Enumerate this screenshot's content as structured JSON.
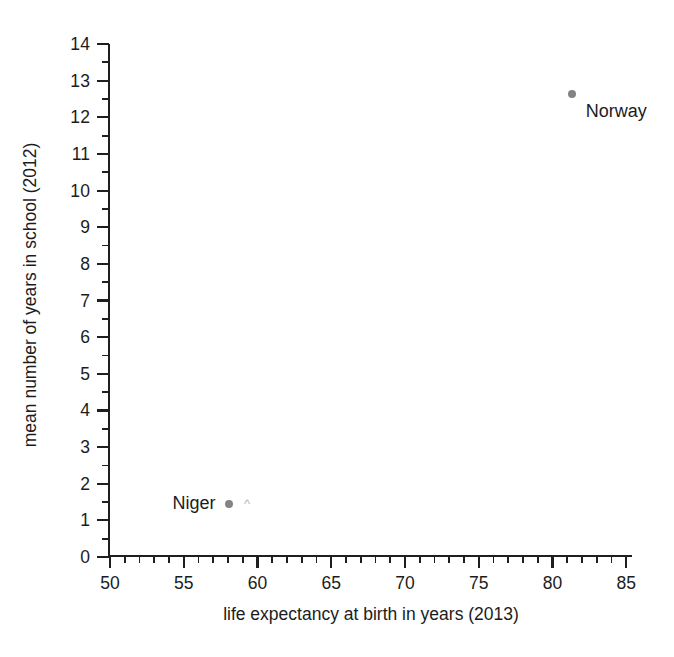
{
  "chart_data": {
    "type": "scatter",
    "title": "",
    "xlabel": "life expectancy at birth in years (2013)",
    "ylabel": "mean number of years in school (2012)",
    "xlim": [
      50,
      85.4
    ],
    "ylim": [
      0,
      14
    ],
    "x_major_ticks": [
      50,
      55,
      60,
      65,
      70,
      75,
      80,
      85
    ],
    "x_major_tick_labels": [
      "50",
      "55",
      "60",
      "65",
      "70",
      "75",
      "80",
      "85"
    ],
    "x_minor_tick_step": 1,
    "y_major_ticks": [
      0,
      1,
      2,
      3,
      4,
      5,
      6,
      7,
      8,
      9,
      10,
      11,
      12,
      13,
      14
    ],
    "y_major_tick_labels": [
      "0",
      "1",
      "2",
      "3",
      "4",
      "5",
      "6",
      "7",
      "8",
      "9",
      "10",
      "11",
      "12",
      "13",
      "14"
    ],
    "y_minor_tick_step": 0.5,
    "grid": false,
    "legend": false,
    "marker_color": "#838383",
    "axis_color": "#1f1f1f",
    "background_color": "#ffffff",
    "points": [
      {
        "label": "Niger",
        "x": 58.1,
        "y": 1.45,
        "label_position": "left"
      },
      {
        "label": "Norway",
        "x": 81.3,
        "y": 12.65,
        "label_position": "below-right"
      }
    ]
  },
  "artifacts": {
    "scan_mark": "^"
  }
}
